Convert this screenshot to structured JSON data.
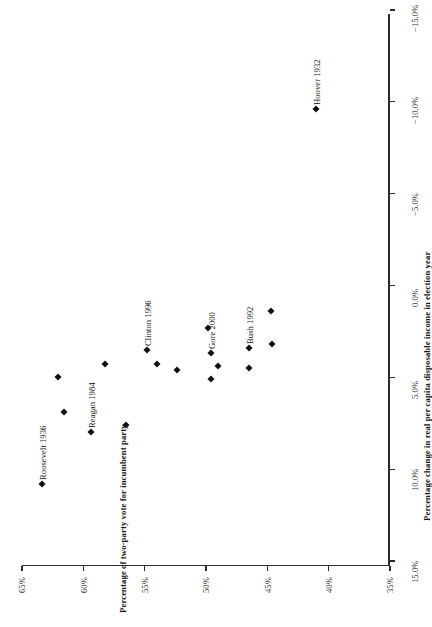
{
  "chart_data": {
    "type": "scatter",
    "title": "",
    "xlabel": "Percentage change in real per capita disposable income in election year",
    "ylabel": "Percentage of two-party vote for incumbent party",
    "xlim": [
      -15.0,
      15.0
    ],
    "ylim": [
      35.0,
      65.0
    ],
    "grid": false,
    "legend": "none",
    "orientation_note": "figure rendered rotated 180 degrees",
    "xticks": [
      "−15.0%",
      "−10.0%",
      "−5.0%",
      "0.0%",
      "5.0%",
      "10.0%",
      "15.0%"
    ],
    "xtick_values": [
      -15.0,
      -10.0,
      -5.0,
      0.0,
      5.0,
      10.0,
      15.0
    ],
    "yticks": [
      "35%",
      "40%",
      "45%",
      "50%",
      "55%",
      "60%",
      "65%"
    ],
    "ytick_values": [
      35,
      40,
      45,
      50,
      55,
      60,
      65
    ],
    "marker": "diamond",
    "marker_color": "#111111",
    "points": [
      {
        "label": "Roosevelt 1936",
        "x": 10.8,
        "y": 63.4,
        "labeled": true
      },
      {
        "label": "Reagan 1984",
        "x": 8.0,
        "y": 59.4,
        "labeled": true
      },
      {
        "label": "Clinton 1996",
        "x": 3.5,
        "y": 54.8,
        "labeled": true
      },
      {
        "label": "Gore 2000",
        "x": 3.7,
        "y": 49.6,
        "labeled": true
      },
      {
        "label": "Bush 1992",
        "x": 3.4,
        "y": 46.5,
        "labeled": true
      },
      {
        "label": "Hoover 1932",
        "x": -9.6,
        "y": 41.0,
        "labeled": true
      },
      {
        "label": "",
        "x": 6.9,
        "y": 61.6,
        "labeled": false
      },
      {
        "label": "",
        "x": 7.6,
        "y": 56.5,
        "labeled": false
      },
      {
        "label": "",
        "x": 5.0,
        "y": 62.1,
        "labeled": false
      },
      {
        "label": "",
        "x": 4.3,
        "y": 58.2,
        "labeled": false
      },
      {
        "label": "",
        "x": 4.3,
        "y": 54.0,
        "labeled": false
      },
      {
        "label": "",
        "x": 4.6,
        "y": 52.4,
        "labeled": false
      },
      {
        "label": "",
        "x": 5.1,
        "y": 49.6,
        "labeled": false
      },
      {
        "label": "",
        "x": 4.4,
        "y": 49.0,
        "labeled": false
      },
      {
        "label": "",
        "x": 4.5,
        "y": 46.5,
        "labeled": false
      },
      {
        "label": "",
        "x": 3.2,
        "y": 44.6,
        "labeled": false
      },
      {
        "label": "",
        "x": 2.3,
        "y": 49.8,
        "labeled": false
      },
      {
        "label": "",
        "x": 1.4,
        "y": 44.7,
        "labeled": false
      }
    ]
  }
}
